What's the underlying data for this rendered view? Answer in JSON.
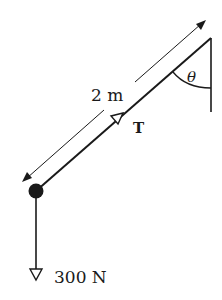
{
  "diagram": {
    "type": "force-diagram",
    "labels": {
      "length": "2 m",
      "tension": "T",
      "angle": "θ",
      "weight": "300 N"
    },
    "elements": {
      "wall": {
        "x": 211,
        "y_top": 38,
        "y_bottom": 112
      },
      "rope": {
        "from": [
          36,
          191
        ],
        "to": [
          211,
          38
        ]
      },
      "mass": {
        "cx": 36,
        "cy": 191,
        "r": 7
      },
      "weight_vector": {
        "from": [
          36,
          191
        ],
        "to": [
          36,
          280
        ]
      },
      "dimension_arrow": {
        "from": [
          22,
          182
        ],
        "to": [
          206,
          20
        ]
      }
    },
    "colors": {
      "ink": "#1a1a1a",
      "background": "#ffffff"
    }
  }
}
